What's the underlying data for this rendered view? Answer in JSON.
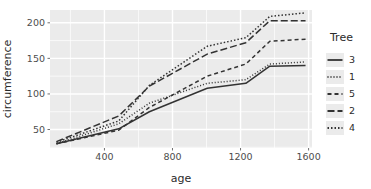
{
  "chart_data": {
    "type": "line",
    "title": "",
    "xlabel": "age",
    "ylabel": "circumference",
    "xlim": [
      80,
      1620
    ],
    "ylim": [
      24,
      218
    ],
    "xticks": [
      400,
      800,
      1200,
      1600
    ],
    "xtick_labels": [
      "400",
      "800",
      "1200",
      "1600"
    ],
    "yticks": [
      50,
      100,
      150,
      200
    ],
    "ytick_labels": [
      "50",
      "100",
      "150",
      "200"
    ],
    "grid": true,
    "grid_color": "#ffffff",
    "panel_background": "#ebebeb",
    "plot_background": "#ffffff",
    "legend_position": "right",
    "legend_title": "Tree",
    "x": [
      118,
      484,
      664,
      1004,
      1231,
      1372,
      1582
    ],
    "series": [
      {
        "name": "3",
        "label": "3",
        "linetype": "solid",
        "dasharray": "none",
        "color": "#333333",
        "values": [
          30,
          51,
          75,
          108,
          115,
          139,
          140
        ]
      },
      {
        "name": "1",
        "label": "1",
        "linetype": "dotted",
        "dasharray": "1,2",
        "color": "#333333",
        "values": [
          30,
          58,
          87,
          115,
          120,
          142,
          145
        ]
      },
      {
        "name": "5",
        "label": "5",
        "linetype": "dashed",
        "dasharray": "4,3",
        "color": "#333333",
        "values": [
          30,
          49,
          81,
          125,
          142,
          174,
          177
        ]
      },
      {
        "name": "2",
        "label": "2",
        "linetype": "longdash",
        "dasharray": "7,3",
        "color": "#333333",
        "values": [
          33,
          69,
          111,
          156,
          172,
          203,
          203
        ]
      },
      {
        "name": "4",
        "label": "4",
        "linetype": "dotdash",
        "dasharray": "1.5,2",
        "color": "#333333",
        "values": [
          32,
          62,
          112,
          167,
          179,
          209,
          214
        ]
      }
    ]
  }
}
